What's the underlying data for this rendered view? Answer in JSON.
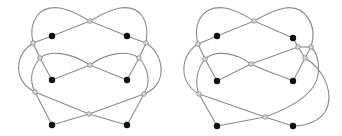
{
  "figures": [
    {
      "id": "left",
      "description": "Knot diagram drawing with 6 black vertices and 9 gray crossings",
      "vertices": [
        [
          52,
          36
        ],
        [
          127,
          36
        ],
        [
          52,
          80
        ],
        [
          127,
          80
        ],
        [
          52,
          125
        ],
        [
          127,
          125
        ]
      ],
      "crossings": [
        [
          90,
          21
        ],
        [
          33,
          43
        ],
        [
          146,
          43
        ],
        [
          40,
          58
        ],
        [
          139,
          58
        ],
        [
          90,
          65
        ],
        [
          35,
          92
        ],
        [
          144,
          94
        ],
        [
          89,
          114
        ]
      ],
      "edges": [
        "M33,43 L52,36 L90,21 L127,36 L146,43",
        "M33,43 C28,20 40,5 60,8 C75,11 82,17 90,21",
        "M90,21 C98,17 105,11 120,8 C140,5 150,20 146,43",
        "M33,43 L40,58 L52,80",
        "M146,43 L139,58 L127,80",
        "M52,80 L90,65 L127,80",
        "M40,58 C50,50 70,52 90,65",
        "M139,58 C128,50 108,52 90,65",
        "M33,43 C15,55 12,80 35,92",
        "M146,43 C165,55 168,85 144,94",
        "M40,58 C30,70 30,82 35,92",
        "M139,58 C150,70 150,85 144,94",
        "M35,92 L52,125",
        "M144,94 L127,125",
        "M35,92 L89,114 L127,125",
        "M144,94 L89,114 L52,125"
      ]
    },
    {
      "id": "right",
      "description": "Variant knot diagram with 6 black vertices and 10 gray crossings",
      "vertices": [
        [
          217,
          36
        ],
        [
          293,
          38
        ],
        [
          217,
          81
        ],
        [
          293,
          81
        ],
        [
          217,
          126
        ],
        [
          293,
          126
        ]
      ],
      "crossings": [
        [
          254,
          21
        ],
        [
          198,
          44
        ],
        [
          298,
          47
        ],
        [
          311,
          47
        ],
        [
          205,
          59
        ],
        [
          305,
          58
        ],
        [
          251,
          64
        ],
        [
          199,
          94
        ],
        [
          265,
          117
        ]
      ],
      "edges": [
        "M198,44 L217,36 L254,21 L293,38 L298,47",
        "M198,44 C192,20 205,5 225,8 C240,11 247,17 254,21",
        "M254,21 C262,17 270,11 285,8 C305,5 318,25 311,47",
        "M198,44 L205,59 L217,81",
        "M217,81 L251,64 L298,47",
        "M298,47 L311,47",
        "M311,47 L305,58 L293,81",
        "M205,59 C215,50 235,52 251,64",
        "M251,64 C262,70 280,75 293,81",
        "M298,47 L305,58",
        "M198,44 C180,55 178,82 199,94",
        "M205,59 C196,70 195,84 199,94",
        "M199,94 L217,126",
        "M199,94 L265,117 L293,126",
        "M217,126 L265,117 C290,108 315,95 318,75 C320,60 316,52 311,47",
        "M305,58 C325,70 335,95 325,112 C318,122 305,126 293,126"
      ]
    }
  ],
  "colors": {
    "background": "#ffffff",
    "edge": "#8a8a8a",
    "vertex": "#111111",
    "crossing_fill": "#d8d8d8"
  }
}
